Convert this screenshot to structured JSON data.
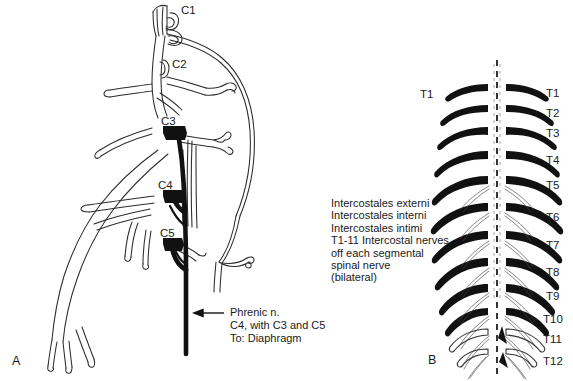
{
  "figure": {
    "width": 573,
    "height": 381,
    "background": "#ffffff",
    "ink": "#1a1a1a",
    "outline": "#2b2b2b"
  },
  "panels": [
    {
      "id": "A",
      "label": "A",
      "x": 12,
      "y": 355
    },
    {
      "id": "B",
      "label": "B",
      "x": 428,
      "y": 354
    }
  ],
  "panel_a": {
    "title": "cervical plexus and phrenic nerve",
    "root_labels": [
      {
        "text": "C1",
        "x": 181,
        "y": 5
      },
      {
        "text": "C2",
        "x": 172,
        "y": 59
      },
      {
        "text": "C3",
        "x": 161,
        "y": 116
      },
      {
        "text": "C4",
        "x": 158,
        "y": 184
      },
      {
        "text": "C5",
        "x": 160,
        "y": 230
      }
    ],
    "callout": {
      "lines": "Phrenic n.\nC4, with C3 and C5\nTo:  Diaphragm",
      "x": 228,
      "y": 307,
      "arrow": {
        "x1": 222,
        "y1": 313,
        "x2": 196,
        "y2": 313
      }
    }
  },
  "center_note": {
    "x": 331,
    "y": 197,
    "lines": "Intercostales externi\nIntercostales interni\nIntercostales intimi\nT1-11 Intercostal nerves\noff each segmental\nspinal nerve\n(bilateral)"
  },
  "panel_b": {
    "title": "thoracic cage, intercostal nerves",
    "spine_x": 497,
    "left_side_label": {
      "text": "T1",
      "x": 420,
      "y": 89
    },
    "rib_labels": [
      {
        "text": "T1",
        "x": 546,
        "y": 88
      },
      {
        "text": "T2",
        "x": 546,
        "y": 108
      },
      {
        "text": "T3",
        "x": 546,
        "y": 128
      },
      {
        "text": "T4",
        "x": 546,
        "y": 155
      },
      {
        "text": "T5",
        "x": 546,
        "y": 180
      },
      {
        "text": "T6",
        "x": 546,
        "y": 212
      },
      {
        "text": "T7",
        "x": 546,
        "y": 240
      },
      {
        "text": "T8",
        "x": 546,
        "y": 267
      },
      {
        "text": "T9",
        "x": 546,
        "y": 291
      },
      {
        "text": "T10",
        "x": 543,
        "y": 314
      },
      {
        "text": "T11",
        "x": 543,
        "y": 334
      },
      {
        "text": "T12",
        "x": 543,
        "y": 356
      }
    ],
    "ribs": [
      {
        "name": "T1",
        "y": 84,
        "filled": true,
        "thickness": 7.0,
        "span": 40,
        "drop": 14
      },
      {
        "name": "T2",
        "y": 105,
        "filled": true,
        "thickness": 7.4,
        "span": 44,
        "drop": 17
      },
      {
        "name": "T3",
        "y": 127,
        "filled": true,
        "thickness": 7.8,
        "span": 48,
        "drop": 20
      },
      {
        "name": "T4",
        "y": 151,
        "filled": true,
        "thickness": 8.0,
        "span": 52,
        "drop": 23
      },
      {
        "name": "T5",
        "y": 176,
        "filled": true,
        "thickness": 8.2,
        "span": 55,
        "drop": 26
      },
      {
        "name": "T6",
        "y": 203,
        "filled": true,
        "thickness": 8.4,
        "span": 57,
        "drop": 29
      },
      {
        "name": "T7",
        "y": 231,
        "filled": true,
        "thickness": 8.4,
        "span": 58,
        "drop": 31
      },
      {
        "name": "T8",
        "y": 258,
        "filled": true,
        "thickness": 8.2,
        "span": 57,
        "drop": 33
      },
      {
        "name": "T9",
        "y": 284,
        "filled": true,
        "thickness": 7.8,
        "span": 54,
        "drop": 34
      },
      {
        "name": "T10",
        "y": 308,
        "filled": true,
        "thickness": 7.2,
        "span": 50,
        "drop": 34
      },
      {
        "name": "T11",
        "y": 329,
        "filled": false,
        "thickness": 4.0,
        "span": 44,
        "drop": 32
      },
      {
        "name": "T12",
        "y": 349,
        "filled": false,
        "thickness": 4.0,
        "span": 36,
        "drop": 26
      }
    ]
  }
}
